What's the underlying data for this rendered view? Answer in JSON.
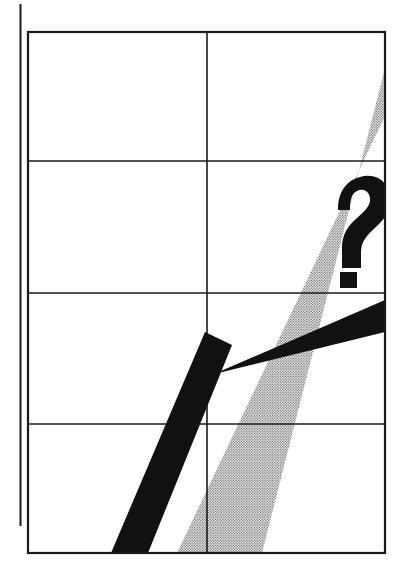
{
  "figure": {
    "title": "",
    "caption": "",
    "kind": "line-art-diagram",
    "background_color": "#ffffff",
    "width": 403,
    "height": 573
  },
  "colors": {
    "ink": "#111111",
    "rule": "#1a1a1a",
    "halftone_dot": "#3a3a3a",
    "halftone_field": "#ffffff",
    "paper": "#ffffff"
  },
  "frame": {
    "name": "grid-frame",
    "x": 28,
    "y": 32,
    "width": 357,
    "height": 521,
    "stroke_width": 2.2
  },
  "margin_rule": {
    "name": "left-margin-rule",
    "x": 20.5,
    "y_top": 4,
    "y_bottom": 526,
    "stroke_width": 2.0
  },
  "grid": {
    "columns": 2,
    "rows": 4,
    "vertical_rules": [
      207
    ],
    "horizontal_rules": [
      161,
      293,
      424
    ],
    "stroke_width": 1.6
  },
  "halftone_band": {
    "name": "halftone-diagonal-band",
    "description": "screened grey diagonal band rising left-to-right",
    "points": "177,553 262,553 385,68 385,116",
    "dot_spacing": 2.6,
    "dot_radius": 0.62,
    "opacity": 1
  },
  "black_shape": {
    "name": "black-check-shape",
    "description": "solid black check / arrow: thick rising diagonal from lower-left meeting a near-horizontal band running to the right edge",
    "diagonal_points": "111,553 148,553 232,345 205,332",
    "horizontal_points": "193,383 385,300 385,332 206,376",
    "vertex": {
      "x": 207,
      "y": 370
    }
  },
  "question_mark": {
    "name": "question-mark-glyph",
    "character": "?",
    "x": 333,
    "y": 182,
    "width": 46,
    "height": 106,
    "bowl": {
      "outer": "M 340 212 C 340 188 356 178 372 182 C 384 185 390 196 389 208 C 388 222 378 231 369 239 C 361 246 357 252 357 262 L 357 266 L 340 266 L 340 258 C 340 244 346 236 355 228 C 362 221 368 214 368 207 C 368 200 363 196 357 197 C 351 198 349 203 349 212 Z",
      "note": "bold slab-ish question bowl with squared terminals"
    },
    "dot": "M 340 272 L 357 272 L 357 288 L 340 288 Z"
  },
  "annotations": []
}
